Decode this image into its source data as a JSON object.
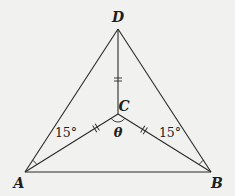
{
  "diagram": {
    "points": {
      "A": {
        "label": "A"
      },
      "B": {
        "label": "B"
      },
      "C": {
        "label": "C"
      },
      "D": {
        "label": "D"
      }
    },
    "segments": [
      {
        "from": "A",
        "to": "B"
      },
      {
        "from": "A",
        "to": "D"
      },
      {
        "from": "B",
        "to": "D"
      },
      {
        "from": "A",
        "to": "C"
      },
      {
        "from": "B",
        "to": "C"
      },
      {
        "from": "D",
        "to": "C"
      }
    ],
    "congruence_marks": {
      "DC": "double-tick",
      "AC": "double-tick",
      "BC": "double-tick"
    },
    "angles": {
      "DAC": {
        "label": "15°"
      },
      "DBC": {
        "label": "15°"
      },
      "ACB": {
        "label": "θ"
      }
    }
  }
}
